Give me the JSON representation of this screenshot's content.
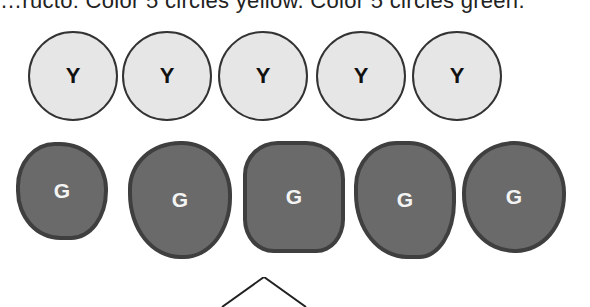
{
  "instruction_text": "…ructo: Color 5 circles yellow. Color 5 circles green.",
  "yellow_circles": [
    {
      "label": "Y"
    },
    {
      "label": "Y"
    },
    {
      "label": "Y"
    },
    {
      "label": "Y"
    },
    {
      "label": "Y"
    }
  ],
  "green_shapes": [
    {
      "label": "G"
    },
    {
      "label": "G"
    },
    {
      "label": "G"
    },
    {
      "label": "G"
    },
    {
      "label": "G"
    }
  ],
  "colors": {
    "circle_fill": "#e6e6e6",
    "blob_fill": "#6a6a6a",
    "outline": "#333333"
  }
}
